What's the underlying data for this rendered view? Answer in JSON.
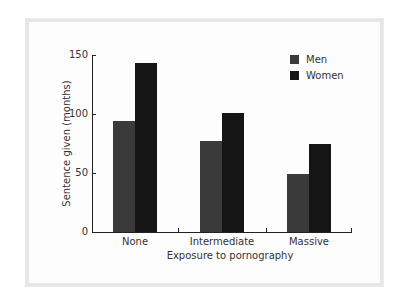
{
  "chart_data": {
    "type": "bar",
    "title": "",
    "xlabel": "Exposure to pornography",
    "ylabel": "Sentence given (months)",
    "categories": [
      "None",
      "Intermediate",
      "Massive"
    ],
    "series": [
      {
        "name": "Men",
        "values": [
          94,
          77,
          49
        ],
        "color": "#3a3a3a"
      },
      {
        "name": "Women",
        "values": [
          143,
          101,
          75
        ],
        "color": "#151515"
      }
    ],
    "ylim": [
      0,
      150
    ],
    "yticks": [
      "0",
      "50",
      "100",
      "150"
    ],
    "grid": false,
    "legend_position": "top-right"
  }
}
